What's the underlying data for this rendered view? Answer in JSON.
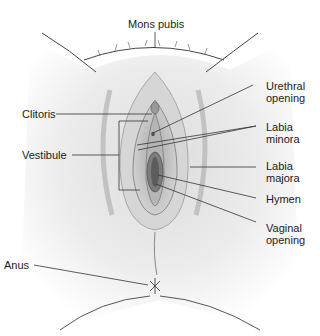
{
  "diagram": {
    "labels": {
      "mons_pubis": "Mons pubis",
      "clitoris": "Clitoris",
      "vestibule": "Vestibule",
      "urethral_opening_1": "Urethral",
      "urethral_opening_2": "opening",
      "labia_minora_1": "Labia",
      "labia_minora_2": "minora",
      "labia_majora_1": "Labia",
      "labia_majora_2": "majora",
      "hymen": "Hymen",
      "vaginal_opening_1": "Vaginal",
      "vaginal_opening_2": "opening",
      "anus": "Anus"
    },
    "colors": {
      "line": "#333333",
      "skin_light": "#eeeeee",
      "skin_mid": "#c8c8c8",
      "skin_dark": "#8a8a8a"
    }
  }
}
